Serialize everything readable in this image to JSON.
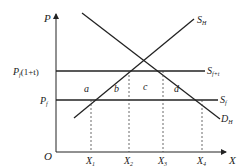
{
  "diagram": {
    "title": "",
    "axes": {
      "y_label": "P",
      "x_label": "X",
      "origin_label": "O"
    },
    "price_levels": [
      {
        "name": "P",
        "sub": "f",
        "suffix": "(1+t)",
        "y": 71
      },
      {
        "name": "P",
        "sub": "f",
        "suffix": "",
        "y": 100
      }
    ],
    "quantity_ticks": [
      {
        "name": "X",
        "sub": "1",
        "x": 91
      },
      {
        "name": "X",
        "sub": "2",
        "x": 129
      },
      {
        "name": "X",
        "sub": "3",
        "x": 163
      },
      {
        "name": "X",
        "sub": "4",
        "x": 202
      }
    ],
    "curves": {
      "domestic_supply": {
        "name": "S",
        "sub": "H"
      },
      "supply_with_tariff": {
        "name": "S",
        "sub": "f+t"
      },
      "foreign_supply": {
        "name": "S",
        "sub": "f"
      },
      "domestic_demand": {
        "name": "D",
        "sub": "H"
      }
    },
    "areas": [
      "a",
      "b",
      "c",
      "d"
    ],
    "colors": {
      "line": "#222222",
      "background": "#ffffff"
    }
  }
}
